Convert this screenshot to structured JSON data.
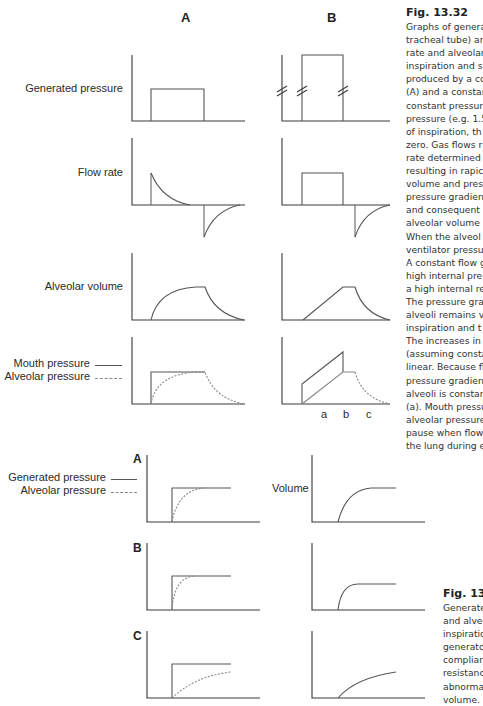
{
  "figure_top": {
    "column_headers": [
      "A",
      "B"
    ],
    "row_labels": {
      "generated_pressure": "Generated pressure",
      "flow_rate": "Flow rate",
      "alveolar_volume": "Alveolar volume",
      "mouth_pressure": "Mouth pressure",
      "alveolar_pressure": "Alveolar pressure"
    },
    "phase_labels": [
      "a",
      "b",
      "c"
    ],
    "caption": {
      "title": "Fig. 13.32",
      "lines": [
        "Graphs of genera",
        "tracheal tube) an",
        "rate and alveolar",
        "inspiration and s",
        "produced by a co",
        "(A) and a constan",
        "constant pressur",
        "pressure (e.g. 1.5",
        "of inspiration, th",
        "zero. Gas flows r",
        "rate determined",
        "resulting in rapic",
        "volume and pres",
        "pressure gradien",
        "and consequent",
        "alveolar volume",
        "When the alveol",
        "ventilator pressu",
        "A constant flow g",
        "high internal pre",
        "a high internal re",
        "The pressure gra",
        "alveoli remains v",
        "inspiration and t",
        "The increases in a",
        "(assuming consta",
        "linear. Because fl",
        "pressure gradien",
        "alveoli is constan",
        "(a). Mouth pressu",
        "alveolar pressure",
        "pause when flow",
        "the lung during e"
      ]
    }
  },
  "figure_bottom": {
    "panel_letters": [
      "A",
      "B",
      "C"
    ],
    "legend": {
      "generated_pressure": "Generated pressure",
      "alveolar_pressure": "Alveolar pressure"
    },
    "volume_label": "Volume",
    "caption": {
      "title": "Fig. 13.3",
      "lines": [
        "Generate",
        "and alvec",
        "inspiratio",
        "generato",
        "complian",
        "resistance",
        "abnorma",
        "volume."
      ]
    }
  },
  "colors": {
    "axis": "#3a3a3a",
    "curve": "#555555",
    "dashed": "#8a8a8a",
    "text": "#2a2a2a"
  }
}
